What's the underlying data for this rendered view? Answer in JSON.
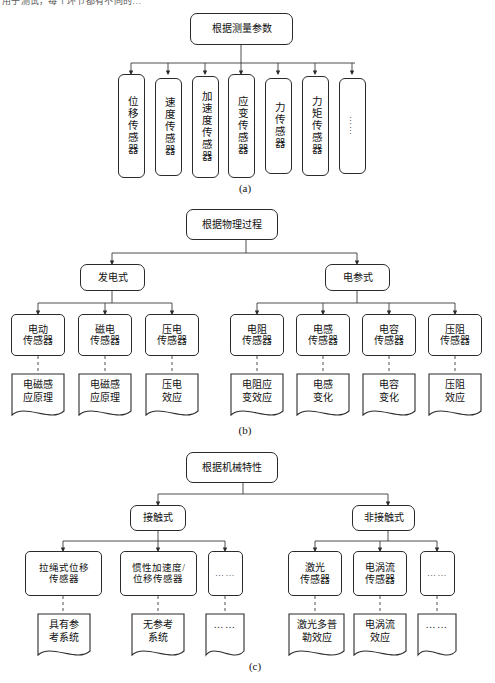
{
  "page": {
    "top_cut_text": "用于测试，每个环节都有不同的…",
    "bg_color": "#ffffff",
    "line_color": "#2b2b2b"
  },
  "panels": [
    {
      "caption": "(a)",
      "root": "根据测量参数",
      "leaves": [
        "位移传感器",
        "速度传感器",
        "加速度传感器",
        "应变传感器",
        "力传感器",
        "力矩传感器",
        "……"
      ]
    },
    {
      "caption": "(b)",
      "root": "根据物理过程",
      "branches": [
        {
          "label": "发电式",
          "children": [
            {
              "name": "电动传感器",
              "principle": "电磁感应原理"
            },
            {
              "name": "磁电传感器",
              "principle": "电磁感应原理"
            },
            {
              "name": "压电传感器",
              "principle": "压电效应"
            }
          ]
        },
        {
          "label": "电参式",
          "children": [
            {
              "name": "电阻传感器",
              "principle": "电阻应变效应"
            },
            {
              "name": "电感传感器",
              "principle": "电感变化"
            },
            {
              "name": "电容传感器",
              "principle": "电容变化"
            },
            {
              "name": "压阻传感器",
              "principle": "压阻效应"
            }
          ]
        }
      ]
    },
    {
      "caption": "(c)",
      "root": "根据机械特性",
      "branches": [
        {
          "label": "接触式",
          "children": [
            {
              "name": "拉绳式位移传感器",
              "principle": "具有参考系统"
            },
            {
              "name": "惯性加速度/位移传感器",
              "principle": "无参考系统"
            },
            {
              "name": "……",
              "principle": "……"
            }
          ]
        },
        {
          "label": "非接触式",
          "children": [
            {
              "name": "激光传感器",
              "principle": "激光多普勒效应"
            },
            {
              "name": "电涡流传感器",
              "principle": "电涡流效应"
            },
            {
              "name": "……",
              "principle": "……"
            }
          ]
        }
      ]
    }
  ],
  "labels": {
    "a_root": "根据测量参数",
    "a_leaf_0": "位移传感器",
    "a_leaf_1": "速度传感器",
    "a_leaf_2": "加速度传感器",
    "a_leaf_3": "应变传感器",
    "a_leaf_4": "力传感器",
    "a_leaf_5": "力矩传感器",
    "a_leaf_6": "……",
    "a_caption": "(a)",
    "b_root": "根据物理过程",
    "b_br0": "发电式",
    "b_br1": "电参式",
    "b_c0": "电动\n传感器",
    "b_c1": "磁电\n传感器",
    "b_c2": "压电\n传感器",
    "b_c3": "电阻\n传感器",
    "b_c4": "电感\n传感器",
    "b_c5": "电容\n传感器",
    "b_c6": "压阻\n传感器",
    "b_p0": "电磁感\n应原理",
    "b_p1": "电磁感\n应原理",
    "b_p2": "压电\n效应",
    "b_p3": "电阻应\n变效应",
    "b_p4": "电感\n变化",
    "b_p5": "电容\n变化",
    "b_p6": "压阻\n效应",
    "b_caption": "(b)",
    "c_root": "根据机械特性",
    "c_br0": "接触式",
    "c_br1": "非接触式",
    "c_c0": "拉绳式位移\n传感器",
    "c_c1": "惯性加速度/\n位移传感器",
    "c_c2": "……",
    "c_c3": "激光\n传感器",
    "c_c4": "电涡流\n传感器",
    "c_c5": "……",
    "c_p0": "具有参\n考系统",
    "c_p1": "无参考\n系统",
    "c_p2": "……",
    "c_p3": "激光多普\n勒效应",
    "c_p4": "电涡流\n效应",
    "c_p5": "……",
    "c_caption": "(c)"
  }
}
